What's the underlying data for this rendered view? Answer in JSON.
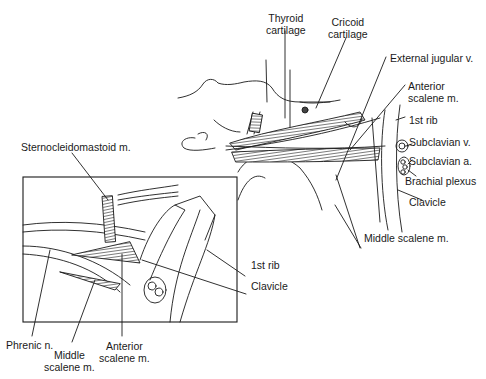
{
  "figure": {
    "main_view": {
      "labels": {
        "thyroid": [
          "Thyroid",
          "cartilage"
        ],
        "cricoid": [
          "Cricoid",
          "cartilage"
        ],
        "external_jugular": "External jugular v.",
        "anterior_scalene": [
          "Anterior",
          "scalene m."
        ],
        "first_rib": "1st rib",
        "subclavian_v": "Subclavian v.",
        "subclavian_a": "Subclavian a.",
        "brachial_plexus": "Brachial plexus",
        "clavicle": "Clavicle",
        "middle_scalene": "Middle scalene m."
      }
    },
    "inset_view": {
      "labels": {
        "sternocleidomastoid": "Sternocleidomastoid m.",
        "first_rib": "1st rib",
        "clavicle": "Clavicle",
        "phrenic": "Phrenic n.",
        "middle_scalene": [
          "Middle",
          "scalene m."
        ],
        "anterior_scalene": [
          "Anterior",
          "scalene m."
        ]
      }
    },
    "colors": {
      "line": "#1a1a1a",
      "muscle_fill": "#555555",
      "background": "#ffffff"
    }
  }
}
